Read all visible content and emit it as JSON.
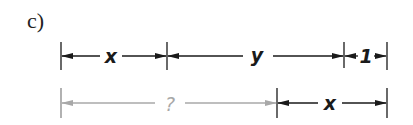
{
  "part_label": "c)",
  "colors": {
    "dark": "#1a1a1a",
    "gray": "#a8a8a8"
  },
  "row1": {
    "segments": [
      {
        "label": "x"
      },
      {
        "label": "y"
      },
      {
        "label": "1"
      }
    ]
  },
  "row2": {
    "segments": [
      {
        "label": "?"
      },
      {
        "label": "x"
      }
    ]
  }
}
